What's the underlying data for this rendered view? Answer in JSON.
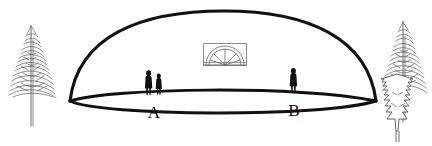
{
  "figure": {
    "background_color": "#ffffff",
    "ink_color": "#111111",
    "tree_ink_color": "#5b5b5b",
    "width": 432,
    "height": 146
  },
  "labels": {
    "point_a": "A",
    "point_b": "B"
  },
  "structure": {
    "dome_name": "dome-outline",
    "base_ellipse_name": "base-ellipse",
    "fanlight_name": "fanlight-window",
    "fanlight_spoke_count": 5
  },
  "people": {
    "group_a": {
      "label": "A",
      "count": 2,
      "description": "two standing silhouette figures"
    },
    "group_b": {
      "label": "B",
      "count": 1,
      "description": "one standing silhouette figure"
    }
  },
  "scenery": {
    "left_tree": "conifer-sketch",
    "right_tall_tree": "conifer-sketch",
    "right_front_tree": "fir-outline"
  }
}
